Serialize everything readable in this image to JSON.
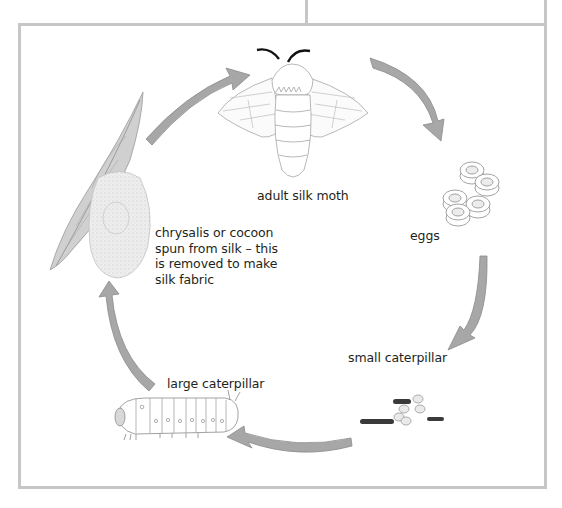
{
  "diagram": {
    "type": "life-cycle",
    "subject": "silk moth",
    "note_box": {
      "visible_text": "",
      "note": "text cut off at top edge; only descenders visible"
    },
    "stages": [
      {
        "id": "adult",
        "label": "adult silk moth",
        "icon": "moth-icon"
      },
      {
        "id": "eggs",
        "label": "eggs",
        "icon": "eggs-icon"
      },
      {
        "id": "small-caterpillar",
        "label": "small caterpillar",
        "icon": "small-caterpillars-icon"
      },
      {
        "id": "large-caterpillar",
        "label": "large caterpillar",
        "icon": "large-caterpillar-icon"
      },
      {
        "id": "cocoon",
        "label_lines": [
          "chrysalis or cocoon",
          "spun from silk – this",
          "is removed to make",
          "silk fabric"
        ],
        "icon": "cocoon-on-leaf-icon"
      }
    ],
    "arrows": [
      {
        "from": "cocoon",
        "to": "adult"
      },
      {
        "from": "adult",
        "to": "eggs"
      },
      {
        "from": "eggs",
        "to": "small-caterpillar"
      },
      {
        "from": "small-caterpillar",
        "to": "large-caterpillar"
      },
      {
        "from": "large-caterpillar",
        "to": "cocoon"
      }
    ],
    "colors": {
      "arrow_fill": "#a7a7a7",
      "arrow_stroke": "#8a8a8a",
      "frame": "#c6c6c6",
      "text": "#231f20"
    }
  }
}
